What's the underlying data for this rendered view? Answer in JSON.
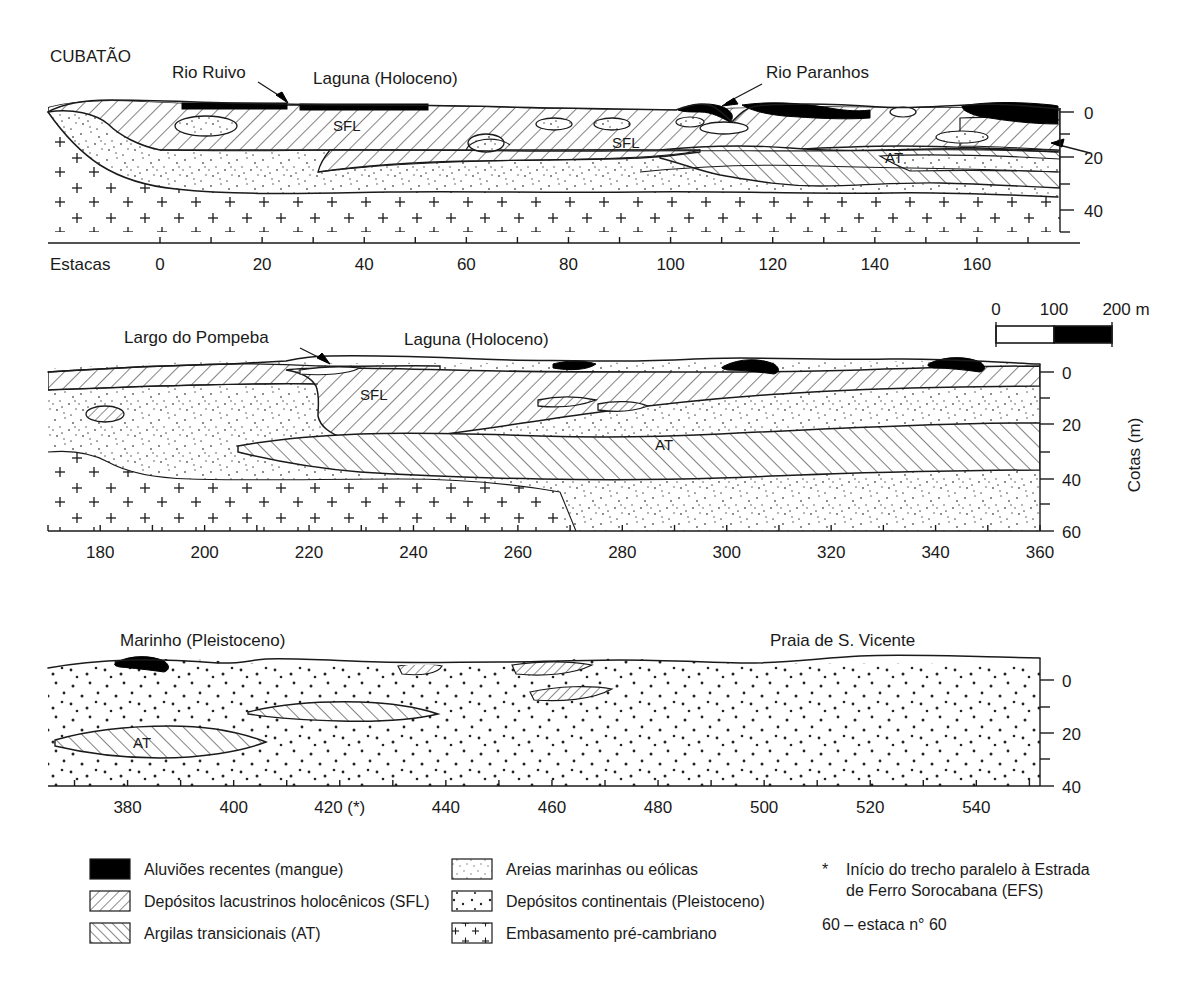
{
  "figure": {
    "type": "geological-cross-section",
    "axis_title_vertical": "Cotas  (m)",
    "estacas_label": "Estacas"
  },
  "scalebar": {
    "labels": [
      "0",
      "100",
      "200 m"
    ],
    "unit": "m",
    "segments": 2,
    "segment_length_m": 100
  },
  "panels": [
    {
      "id": "panel-1",
      "place_labels": [
        {
          "name": "CUBATÃO",
          "text": "CUBATÃO"
        },
        {
          "name": "Rio Ruivo",
          "text": "Rio Ruivo"
        },
        {
          "name": "Laguna (Holoceno)",
          "text": "Laguna  (Holoceno)"
        },
        {
          "name": "Rio Paranhos",
          "text": "Rio Paranhos"
        }
      ],
      "unit_codes": [
        "SFL",
        "SFL",
        "AT"
      ],
      "x_ticks_major": [
        "0",
        "20",
        "40",
        "60",
        "80",
        "100",
        "120",
        "140",
        "160"
      ],
      "x_min": 0,
      "x_max": 170,
      "x_step": 10,
      "y_ticks": [
        "0",
        "20",
        "40"
      ],
      "y_min": 0,
      "y_max": 50
    },
    {
      "id": "panel-2",
      "place_labels": [
        {
          "name": "Largo do Pompeba",
          "text": "Largo do Pompeba"
        },
        {
          "name": "Laguna (Holoceno)",
          "text": "Laguna  (Holoceno)"
        }
      ],
      "unit_codes": [
        "SFL",
        "AT"
      ],
      "x_ticks_major": [
        "180",
        "200",
        "220",
        "240",
        "260",
        "280",
        "300",
        "320",
        "340",
        "360"
      ],
      "x_min": 170,
      "x_max": 360,
      "x_step": 10,
      "y_ticks": [
        "0",
        "20",
        "40",
        "60"
      ],
      "y_min": 0,
      "y_max": 60
    },
    {
      "id": "panel-3",
      "place_labels": [
        {
          "name": "Marinho (Pleistoceno)",
          "text": "Marinho  (Pleistoceno)"
        },
        {
          "name": "Praia de S. Vicente",
          "text": "Praia de S. Vicente"
        }
      ],
      "unit_codes": [
        "AT"
      ],
      "x_ticks_major": [
        "380",
        "400",
        "420 (*)",
        "440",
        "460",
        "480",
        "500",
        "520",
        "540"
      ],
      "x_min": 365,
      "x_max": 552,
      "x_step": 10,
      "y_ticks": [
        "0",
        "20",
        "40"
      ],
      "y_min": 0,
      "y_max": 40
    }
  ],
  "legend": {
    "column1": [
      {
        "pattern": "solid-black",
        "text": "Aluviões recentes (mangue)"
      },
      {
        "pattern": "hatch-forward",
        "text": "Depósitos lacustrinos holocênicos (SFL)"
      },
      {
        "pattern": "hatch-backward",
        "text": "Argilas transicionais (AT)"
      }
    ],
    "column2": [
      {
        "pattern": "fine-stipple",
        "text": "Areias marinhas ou eólicas"
      },
      {
        "pattern": "coarse-stipple",
        "text": "Depósitos continentais (Pleistoceno)"
      },
      {
        "pattern": "plus-signs",
        "text": "Embasamento pré-cambriano"
      }
    ],
    "column3": [
      {
        "marker": "*",
        "text_line1": "Início do trecho paralelo à Estrada",
        "text_line2": "de Ferro Sorocabana (EFS)"
      },
      {
        "marker": "",
        "text_line1": "60 – estaca n° 60",
        "text_line2": ""
      }
    ]
  },
  "colors": {
    "ink": "#1a1a1a",
    "black_fill": "#000000",
    "paper": "#ffffff"
  }
}
